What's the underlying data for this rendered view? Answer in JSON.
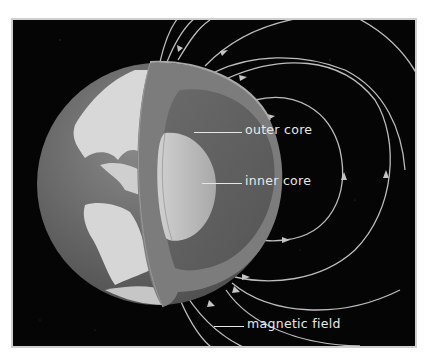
{
  "diagram": {
    "labels": [
      {
        "id": "outer_core",
        "text": "outer core"
      },
      {
        "id": "inner_core",
        "text": "inner core"
      },
      {
        "id": "magnetic_field",
        "text": "magnetic field"
      }
    ],
    "colors": {
      "background": "#050505",
      "frame": "#cfcfcf",
      "ocean": "#6e6e6e",
      "land": "#d6d6d6",
      "mantle": "#7a7a7a",
      "outer_core": "#5f5f5f",
      "inner_core": "#bdbdbd",
      "field_lines": "#bfbfbf",
      "label_text": "#e8e8e8"
    }
  }
}
